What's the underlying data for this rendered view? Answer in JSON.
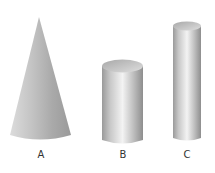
{
  "figure": {
    "shapes": [
      {
        "id": "A",
        "type": "cone",
        "label": "A"
      },
      {
        "id": "B",
        "type": "cylinder",
        "label": "B"
      },
      {
        "id": "C",
        "type": "cylinder",
        "label": "C"
      }
    ],
    "colors": {
      "background": "#ffffff",
      "shade_dark": "#8e8e8e",
      "shade_mid": "#bdbdbd",
      "highlight": "#f2f2f2",
      "label": "#333333"
    }
  }
}
